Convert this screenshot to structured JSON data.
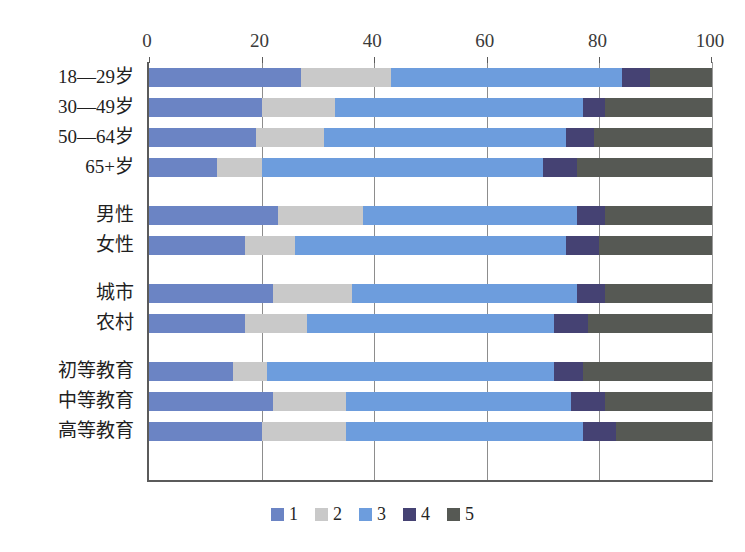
{
  "chart_data": {
    "type": "bar",
    "orientation": "horizontal",
    "stacked": true,
    "stacked_percent": true,
    "title": "",
    "subtitle": "",
    "xlabel": "",
    "ylabel": "",
    "xlim": [
      0,
      100
    ],
    "xticks": [
      0,
      20,
      40,
      60,
      80,
      100
    ],
    "xtick_labels": [
      "0",
      "20",
      "40",
      "60",
      "80",
      "100"
    ],
    "grid": true,
    "grid_axis": "x",
    "legend_position": "bottom-center",
    "legend": [
      "1",
      "2",
      "3",
      "4",
      "5"
    ],
    "colors": [
      "#6b84c4",
      "#c9c9c9",
      "#6d9ddd",
      "#454273",
      "#565954"
    ],
    "categories": [
      "18—29岁",
      "30—49岁",
      "50—64岁",
      "65+岁",
      "男性",
      "女性",
      "城市",
      "农村",
      "初等教育",
      "中等教育",
      "高等教育"
    ],
    "group_breaks_after": [
      3,
      5,
      7
    ],
    "series": [
      {
        "name": "1",
        "color": "#6b84c4",
        "values": [
          27,
          20,
          19,
          12,
          23,
          17,
          22,
          17,
          15,
          22,
          20
        ]
      },
      {
        "name": "2",
        "color": "#c9c9c9",
        "values": [
          16,
          13,
          12,
          8,
          15,
          9,
          14,
          11,
          6,
          13,
          15
        ]
      },
      {
        "name": "3",
        "color": "#6d9ddd",
        "values": [
          41,
          44,
          43,
          50,
          38,
          48,
          40,
          44,
          51,
          40,
          42
        ]
      },
      {
        "name": "4",
        "color": "#454273",
        "values": [
          5,
          4,
          5,
          6,
          5,
          6,
          5,
          6,
          5,
          6,
          6
        ]
      },
      {
        "name": "5",
        "color": "#565954",
        "values": [
          11,
          19,
          21,
          24,
          19,
          20,
          19,
          22,
          23,
          19,
          17
        ]
      }
    ]
  }
}
